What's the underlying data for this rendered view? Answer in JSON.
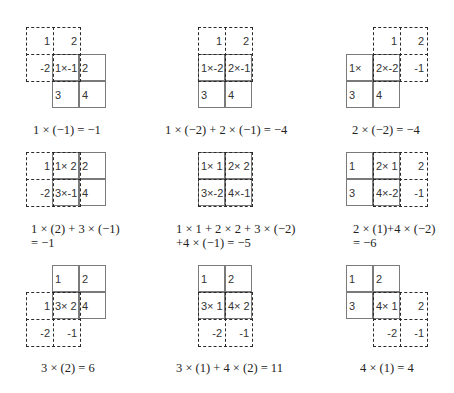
{
  "input_matrix": [
    [
      1,
      2
    ],
    [
      3,
      4
    ]
  ],
  "kernel_matrix": [
    [
      1,
      2
    ],
    [
      -2,
      -1
    ]
  ],
  "colors": {
    "solid_grid": "#7a7a7a",
    "kernel_dashed": "#2a2a2a",
    "text": "#333333"
  },
  "panels": [
    {
      "id": "r1c1",
      "cells": [
        "-2",
        "1×-1",
        "2",
        "",
        "3",
        "4"
      ],
      "grid": [
        "",
        "",
        "1×-1",
        "2",
        "3",
        "4"
      ],
      "kernel": [
        "1",
        "2",
        "-2",
        "1×-1"
      ],
      "labels": {
        "k00": "1",
        "k01": "2",
        "k10": "-2",
        "g00": "1×-1",
        "g01": "2",
        "g10": "3",
        "g11": "4"
      },
      "caption": [
        "1 × (−1) = −1"
      ]
    },
    {
      "id": "r1c2",
      "labels": {
        "k00": "1",
        "k01": "2",
        "g00": "1×-2",
        "g01": "2×-1",
        "g10": "3",
        "g11": "4"
      },
      "caption": [
        "1 × (−2) + 2 × (−1) = −4"
      ]
    },
    {
      "id": "r1c3",
      "labels": {
        "k00": "1",
        "k01": "2",
        "k11": "-1",
        "g00": "1×",
        "g01": "2×-2",
        "g10": "3",
        "g11": "4"
      },
      "caption": [
        "2 × (−2) = −4"
      ]
    },
    {
      "id": "r2c1",
      "labels": {
        "k00": "1",
        "k10": "-2",
        "g00": "1× 2",
        "g01": "2",
        "g10": "3×-1",
        "g11": "4"
      },
      "caption": [
        "1 × (2) + 3 × (−1)",
        "= −1"
      ]
    },
    {
      "id": "r2c2",
      "labels": {
        "g00": "1× 1",
        "g01": "2× 2",
        "g10": "3×-2",
        "g11": "4×-1"
      },
      "caption": [
        "1 × 1 + 2 × 2 + 3 × (−2)",
        "+4 × (−1) = −5"
      ]
    },
    {
      "id": "r2c3",
      "labels": {
        "g00": "1",
        "g01": "2× 1",
        "k01": "2",
        "g10": "3",
        "g11": "4×-2",
        "k11": "-1"
      },
      "caption": [
        "2 × (1)+4 × (−2)",
        "= −6"
      ]
    },
    {
      "id": "r3c1",
      "labels": {
        "g00": "1",
        "g01": "2",
        "k00": "1",
        "g10": "3× 2",
        "g11": "4",
        "k10": "-2",
        "k11": "-1"
      },
      "caption": [
        "3 × (2) = 6"
      ]
    },
    {
      "id": "r3c2",
      "labels": {
        "g00": "1",
        "g01": "2",
        "g10": "3× 1",
        "g11": "4× 2",
        "k10": "-2",
        "k11": "-1"
      },
      "caption": [
        "3 × (1) + 4 × (2) = 11"
      ]
    },
    {
      "id": "r3c3",
      "labels": {
        "g00": "1",
        "g01": "2",
        "g10": "3",
        "g11": "4× 1",
        "k01": "2",
        "k10": "-2",
        "k11": "-1"
      },
      "caption": [
        "4 × (1) = 4"
      ]
    }
  ]
}
